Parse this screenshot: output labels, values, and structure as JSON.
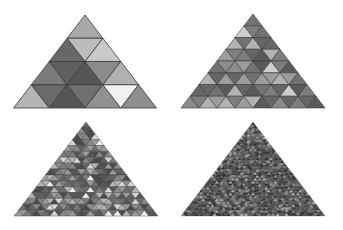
{
  "figure": {
    "background": "#ffffff",
    "stroke": "#3a3a3a",
    "panels": [
      {
        "id": "level-1",
        "rows": 4,
        "apex": [
          85,
          15
        ],
        "base_left": [
          14,
          108
        ],
        "base_right": [
          157,
          108
        ],
        "colors": [
          [
            "#a9a9a9"
          ],
          [
            "#676767",
            "#bcbcbc",
            "#c9c9c9"
          ],
          [
            "#7b7b7b",
            "#5f5f5f",
            "#565656",
            "#8b8b8b",
            "#b1b1b1"
          ],
          [
            "#b5b5b5",
            "#6a6a6a",
            "#555555",
            "#6f6f6f",
            "#919191",
            "#f1f1f1",
            "#8f8f8f"
          ]
        ]
      },
      {
        "id": "level-2",
        "rows": 8,
        "apex": [
          253,
          14
        ],
        "base_left": [
          183,
          108
        ],
        "base_right": [
          327,
          108
        ],
        "seed": 17,
        "palette": [
          "#5a5a5a",
          "#666666",
          "#727272",
          "#7e7e7e",
          "#8c8c8c",
          "#9c9c9c",
          "#b2b2b2",
          "#cfcfcf",
          "#ececec"
        ]
      },
      {
        "id": "level-3",
        "rows": 16,
        "apex": [
          86,
          122
        ],
        "base_left": [
          14,
          216
        ],
        "base_right": [
          158,
          216
        ],
        "seed": 91,
        "palette": [
          "#4a4a4a",
          "#565656",
          "#626262",
          "#6e6e6e",
          "#7c7c7c",
          "#8a8a8a",
          "#9c9c9c",
          "#b4b4b4",
          "#d6d6d6",
          "#eeeeee"
        ]
      },
      {
        "id": "level-4",
        "rows": 32,
        "apex": [
          253,
          122
        ],
        "base_left": [
          181,
          216
        ],
        "base_right": [
          325,
          216
        ],
        "seed": 203,
        "palette": [
          "#2e2e2e",
          "#3a3a3a",
          "#454545",
          "#505050",
          "#5c5c5c",
          "#6a6a6a",
          "#7c7c7c",
          "#959595",
          "#b5b5b5"
        ]
      }
    ]
  }
}
